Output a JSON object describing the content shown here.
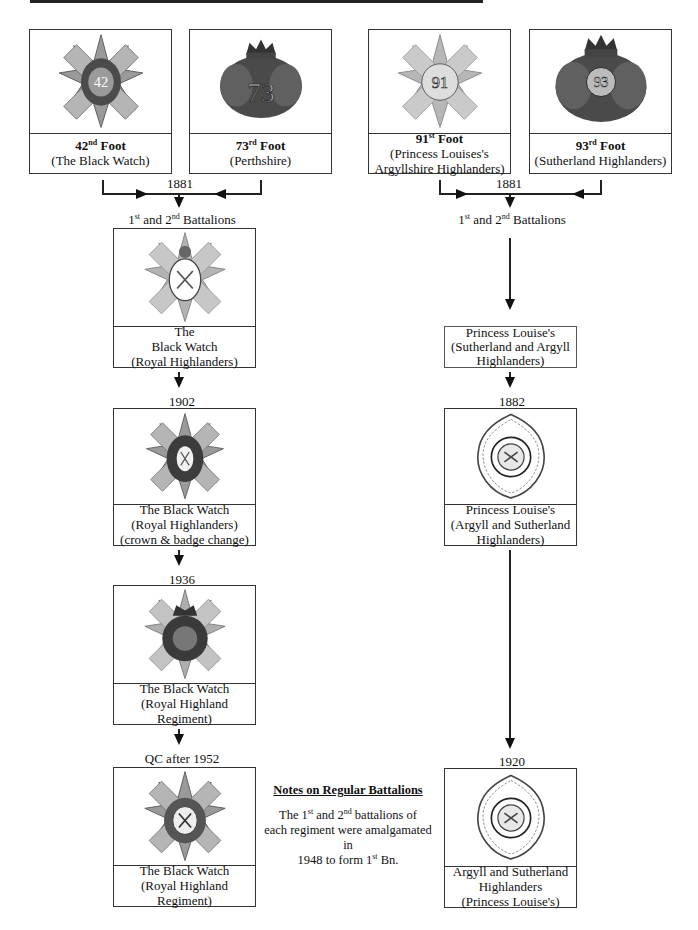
{
  "colors": {
    "line": "#222222",
    "badge_grey": "#8a8a8a",
    "badge_dark": "#3a3a3a",
    "background": "#ffffff"
  },
  "origin_regiments": [
    {
      "id": "42nd",
      "num": "42",
      "sup": "nd",
      "suffix": " Foot",
      "subtitle": "(The Black Watch)",
      "badge_icon": "star-thistle-badge-42"
    },
    {
      "id": "73rd",
      "num": "73",
      "sup": "rd",
      "suffix": " Foot",
      "subtitle": "(Perthshire)",
      "badge_icon": "crown-wreath-badge-73"
    },
    {
      "id": "91st",
      "num": "91",
      "sup": "st",
      "suffix": " Foot",
      "subtitle": "(Princess Louises's",
      "subtitle2": "Argyllshire Highlanders)",
      "badge_icon": "star-badge-91"
    },
    {
      "id": "93rd",
      "num": "93",
      "sup": "rd",
      "suffix": " Foot",
      "subtitle": "(Sutherland Highlanders)",
      "badge_icon": "crown-wreath-badge-93"
    }
  ],
  "left_chain": {
    "merge_year": "1881",
    "battalions_label": {
      "pre": "1",
      "sup1": "st",
      "mid": " and 2",
      "sup2": "nd",
      "post": " Battalions"
    },
    "stages": [
      {
        "year": "",
        "lines": [
          "The",
          "Black Watch",
          "(Royal Highlanders)"
        ]
      },
      {
        "year": "1902",
        "lines": [
          "The Black Watch",
          "(Royal Highlanders)",
          "(crown & badge change)"
        ]
      },
      {
        "year": "1936",
        "lines": [
          "The Black Watch",
          "(Royal Highland",
          "Regiment)"
        ]
      },
      {
        "year": "QC after 1952",
        "lines": [
          "The Black Watch",
          "(Royal Highland",
          "Regiment)"
        ]
      }
    ]
  },
  "right_chain": {
    "merge_year": "1881",
    "battalions_label": {
      "pre": "1",
      "sup1": "st",
      "mid": " and 2",
      "sup2": "nd",
      "post": " Battalions"
    },
    "interim": [
      "Princess Louise's",
      "(Sutherland and Argyll",
      "Highlanders)"
    ],
    "stages": [
      {
        "year": "1882",
        "lines": [
          "Princess Louise's",
          "(Argyll and Sutherland",
          "Highlanders)"
        ]
      },
      {
        "year": "1920",
        "lines": [
          "Argyll and Sutherland",
          "Highlanders",
          "(Princess Louise's)"
        ]
      }
    ]
  },
  "notes": {
    "title": "Notes on Regular Battalions",
    "t1": "The 1",
    "s1": "st",
    "t2": " and 2",
    "s2": "nd",
    "t3": " battalions of",
    "t4": "each regiment were amalgamated in",
    "t5": "1948 to form 1",
    "s3": "st",
    "t6": " Bn."
  }
}
